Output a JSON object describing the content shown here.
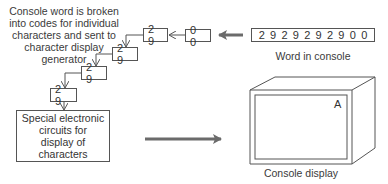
{
  "description_label": "Console word is broken into codes for individual characters and sent to character display generator",
  "description_lines": [
    "Console word is broken",
    "into codes for individual",
    "characters and sent to",
    "character display",
    "generator"
  ],
  "console_word": {
    "digits": [
      "2",
      "9",
      "2",
      "9",
      "2",
      "9",
      "2",
      "9",
      "0",
      "0"
    ],
    "label": "Word in console"
  },
  "code_boxes": [
    {
      "value": "0 0"
    },
    {
      "value": "2 9"
    },
    {
      "value": "2 9"
    },
    {
      "value": "2 9"
    },
    {
      "value": "2 9"
    }
  ],
  "generator": {
    "lines": [
      "Special electronic",
      "circuits for",
      "display of",
      "characters"
    ]
  },
  "display": {
    "character": "A",
    "label": "Console display"
  },
  "colors": {
    "line": "#555555",
    "thick_arrow": "#6b6b6b",
    "text": "#333333"
  }
}
